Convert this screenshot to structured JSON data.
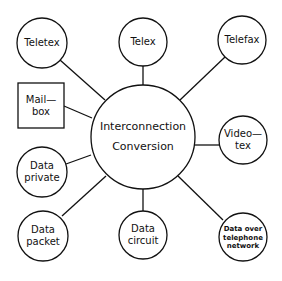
{
  "center": {
    "line1": "Interconnection",
    "line2": "Conversion"
  },
  "nodes": {
    "teletex": {
      "line1": "Teletex"
    },
    "telex": {
      "line1": "Telex"
    },
    "telefax": {
      "line1": "Telefax"
    },
    "mailbox": {
      "line1": "Mail—",
      "line2": "box"
    },
    "videotex": {
      "line1": "Video—",
      "line2": "tex"
    },
    "data_private": {
      "line1": "Data",
      "line2": "private"
    },
    "data_packet": {
      "line1": "Data",
      "line2": "packet"
    },
    "data_circuit": {
      "line1": "Data",
      "line2": "circuit"
    },
    "data_telephone": {
      "line1": "Data over",
      "line2": "telephone",
      "line3": "network"
    }
  },
  "colors": {
    "stroke": "#111111",
    "background": "#ffffff"
  }
}
